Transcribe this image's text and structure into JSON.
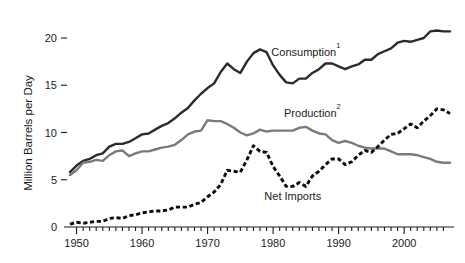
{
  "chart_data": {
    "type": "line",
    "title": "",
    "subtitle": "",
    "xlabel": "",
    "ylabel": "Million Barrels per Day",
    "xlim": [
      1949,
      2007
    ],
    "ylim": [
      0,
      21.5
    ],
    "yticks": [
      0,
      5,
      10,
      15,
      20
    ],
    "ytick_labels": [
      "0",
      "5",
      "10",
      "15",
      "20"
    ],
    "xticks": [
      1950,
      1960,
      1970,
      1980,
      1990,
      2000
    ],
    "xtick_labels": [
      "1950",
      "1960",
      "1970",
      "1980",
      "1990",
      "2000"
    ],
    "minor_xtick_interval": 1,
    "grid": false,
    "legend_position": "inline-annotations",
    "x": [
      1949,
      1950,
      1951,
      1952,
      1953,
      1954,
      1955,
      1956,
      1957,
      1958,
      1959,
      1960,
      1961,
      1962,
      1963,
      1964,
      1965,
      1966,
      1967,
      1968,
      1969,
      1970,
      1971,
      1972,
      1973,
      1974,
      1975,
      1976,
      1977,
      1978,
      1979,
      1980,
      1981,
      1982,
      1983,
      1984,
      1985,
      1986,
      1987,
      1988,
      1989,
      1990,
      1991,
      1992,
      1993,
      1994,
      1995,
      1996,
      1997,
      1998,
      1999,
      2000,
      2001,
      2002,
      2003,
      2004,
      2005,
      2006,
      2007
    ],
    "series": [
      {
        "name": "Consumption",
        "label": "Consumption",
        "superscript": "1",
        "color": "#2b2b2b",
        "style": "solid",
        "label_x": 1985,
        "label_y": 18.1,
        "values": [
          5.8,
          6.5,
          7.0,
          7.2,
          7.6,
          7.8,
          8.5,
          8.8,
          8.8,
          9.0,
          9.4,
          9.8,
          9.9,
          10.3,
          10.7,
          11.0,
          11.5,
          12.1,
          12.6,
          13.4,
          14.1,
          14.7,
          15.2,
          16.4,
          17.3,
          16.7,
          16.3,
          17.5,
          18.4,
          18.8,
          18.5,
          17.1,
          16.1,
          15.3,
          15.2,
          15.7,
          15.7,
          16.3,
          16.7,
          17.3,
          17.3,
          17.0,
          16.7,
          17.0,
          17.2,
          17.7,
          17.7,
          18.3,
          18.6,
          18.9,
          19.5,
          19.7,
          19.6,
          19.8,
          20.0,
          20.7,
          20.8,
          20.7,
          20.7
        ]
      },
      {
        "name": "Production",
        "label": "Production",
        "superscript": "2",
        "color": "#7a7a7a",
        "style": "solid",
        "label_x": 1986,
        "label_y": 11.6,
        "values": [
          5.5,
          6.0,
          6.8,
          6.9,
          7.1,
          7.0,
          7.6,
          8.0,
          8.1,
          7.5,
          7.8,
          8.0,
          8.0,
          8.2,
          8.4,
          8.5,
          8.7,
          9.2,
          9.8,
          10.1,
          10.2,
          11.3,
          11.2,
          11.2,
          10.9,
          10.5,
          10.0,
          9.7,
          9.9,
          10.3,
          10.1,
          10.2,
          10.2,
          10.2,
          10.2,
          10.5,
          10.6,
          10.2,
          9.9,
          9.8,
          9.2,
          8.9,
          9.1,
          8.9,
          8.6,
          8.4,
          8.3,
          8.3,
          8.3,
          8.0,
          7.7,
          7.7,
          7.7,
          7.6,
          7.4,
          7.2,
          6.9,
          6.8,
          6.8
        ]
      },
      {
        "name": "Net Imports",
        "label": "Net Imports",
        "superscript": "",
        "color": "#0d0d0d",
        "style": "dashed",
        "label_x": 1983,
        "label_y": 2.9,
        "values": [
          0.3,
          0.5,
          0.4,
          0.5,
          0.6,
          0.6,
          0.9,
          1.0,
          0.9,
          1.2,
          1.3,
          1.5,
          1.6,
          1.7,
          1.7,
          1.8,
          2.1,
          2.1,
          2.1,
          2.4,
          2.6,
          3.2,
          3.7,
          4.5,
          6.0,
          5.9,
          5.8,
          7.1,
          8.6,
          8.0,
          7.9,
          6.4,
          5.4,
          4.3,
          4.3,
          4.7,
          4.3,
          5.4,
          5.9,
          6.6,
          7.2,
          7.2,
          6.6,
          6.9,
          7.6,
          8.1,
          7.9,
          8.5,
          9.2,
          9.8,
          9.9,
          10.4,
          10.9,
          10.5,
          11.2,
          11.8,
          12.5,
          12.4,
          12.0
        ]
      }
    ],
    "footnote_markers": [
      "1",
      "2"
    ]
  }
}
